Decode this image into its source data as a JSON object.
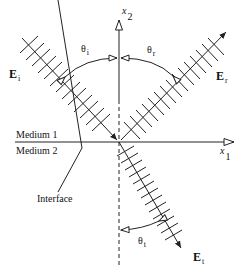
{
  "diagram": {
    "type": "wave-reflection-refraction",
    "axes": {
      "x1": {
        "label": "x",
        "subscript": "1"
      },
      "x2": {
        "label": "x",
        "subscript": "2"
      }
    },
    "fields": {
      "incident": {
        "label": "E",
        "subscript": "i"
      },
      "reflected": {
        "label": "E",
        "subscript": "r"
      },
      "transmitted": {
        "label": "E",
        "subscript": "t"
      }
    },
    "angles": {
      "incident": {
        "label": "θ",
        "subscript": "i"
      },
      "reflected": {
        "label": "θ",
        "subscript": "r"
      },
      "transmitted": {
        "label": "θ",
        "subscript": "t"
      }
    },
    "media": {
      "upper": "Medium 1",
      "lower": "Medium 2"
    },
    "interface_label": "Interface",
    "colors": {
      "stroke": "#222222",
      "background": "#ffffff"
    }
  }
}
